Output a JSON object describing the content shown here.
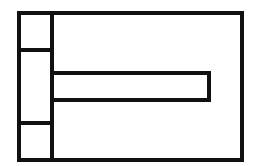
{
  "diagram": {
    "type": "block-outline",
    "stroke_color": "#111111",
    "background": "#ffffff",
    "shapes": [
      {
        "name": "outer-frame",
        "x": 19,
        "y": 13,
        "w": 223,
        "h": 147
      },
      {
        "name": "left-column",
        "x": 19,
        "y": 13,
        "w": 33,
        "h": 147
      },
      {
        "name": "left-top-cell",
        "divider_y": 50
      },
      {
        "name": "left-bottom-cell",
        "divider_y": 123
      },
      {
        "name": "horizontal-bar",
        "x": 52,
        "y": 73,
        "w": 157,
        "h": 27
      }
    ]
  }
}
